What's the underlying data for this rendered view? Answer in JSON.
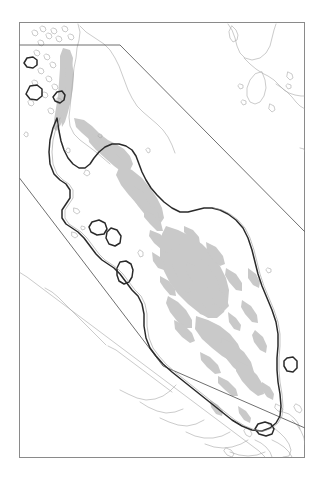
{
  "figure": {
    "kind": "map",
    "title": "",
    "caption": "",
    "background_color": "#ffffff",
    "width": 325,
    "height": 477
  },
  "map": {
    "region_name": "Malay Peninsula",
    "projection_note": "",
    "frame": {
      "x": 19,
      "y": 22,
      "width": 286,
      "height": 436,
      "stroke_color": "#8a8a8a",
      "stroke_width": 1,
      "fill_color": "#ffffff"
    },
    "layers": [
      {
        "id": "terrain-shading",
        "label": "terrain-shading",
        "fill_color": "#c9c9c9",
        "stroke_color": "none",
        "description": "gray upland / elevation shading inside peninsula"
      },
      {
        "id": "coastline",
        "label": "coastline",
        "fill_color": "none",
        "stroke_color": "#a8a8a8",
        "stroke_width": 0.6,
        "description": "light gray regional coastlines and islands"
      },
      {
        "id": "study-area-boundary",
        "label": "study-area-boundary",
        "fill_color": "none",
        "stroke_color": "#2a2a2a",
        "stroke_width": 1.5,
        "description": "dark outlined boundary tracing the peninsula and islands"
      },
      {
        "id": "sector-lines",
        "label": "sector-lines",
        "fill_color": "none",
        "stroke_color": "#4a4a4a",
        "stroke_width": 0.8,
        "description": "straight ruled lines crossing the frame"
      }
    ],
    "legend": {
      "visible": false,
      "entries": []
    },
    "scale_bar": {
      "visible": false,
      "label": ""
    },
    "north_arrow": {
      "visible": false,
      "label": ""
    },
    "axis_labels": {
      "visible": false,
      "x_ticks": [],
      "y_ticks": []
    },
    "annotations": []
  },
  "chart_data": {
    "type": "map",
    "title": "",
    "xlabel": "",
    "ylabel": "",
    "grid": false,
    "legend_position": "none"
  }
}
